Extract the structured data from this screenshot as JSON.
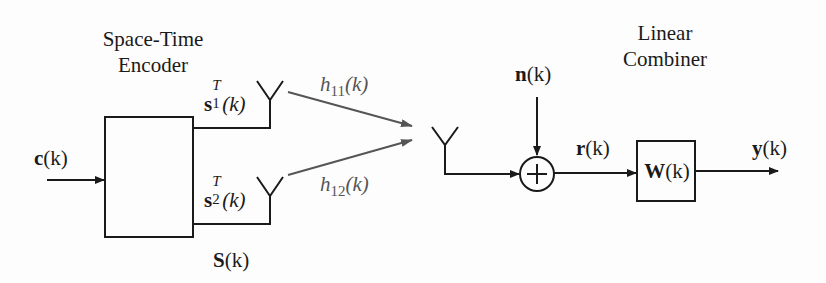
{
  "diagram": {
    "encoder": {
      "title_line1": "Space-Time",
      "title_line2": "Encoder",
      "input_label": "c",
      "matrix_label": "S",
      "stream1": {
        "symbol": "s",
        "sup": "T",
        "sub": "1"
      },
      "stream2": {
        "symbol": "s",
        "sup": "T",
        "sub": "2"
      }
    },
    "channels": {
      "h11": {
        "symbol": "h",
        "sub": "11"
      },
      "h12": {
        "symbol": "h",
        "sub": "12"
      }
    },
    "noise": {
      "label": "n"
    },
    "received": {
      "label": "r"
    },
    "combiner": {
      "title_line1": "Linear",
      "title_line2": "Combiner",
      "box_label": "W"
    },
    "output": {
      "label": "y"
    },
    "arg": "(k)",
    "colors": {
      "line": "#1a1a1a",
      "channel": "#555555"
    }
  }
}
